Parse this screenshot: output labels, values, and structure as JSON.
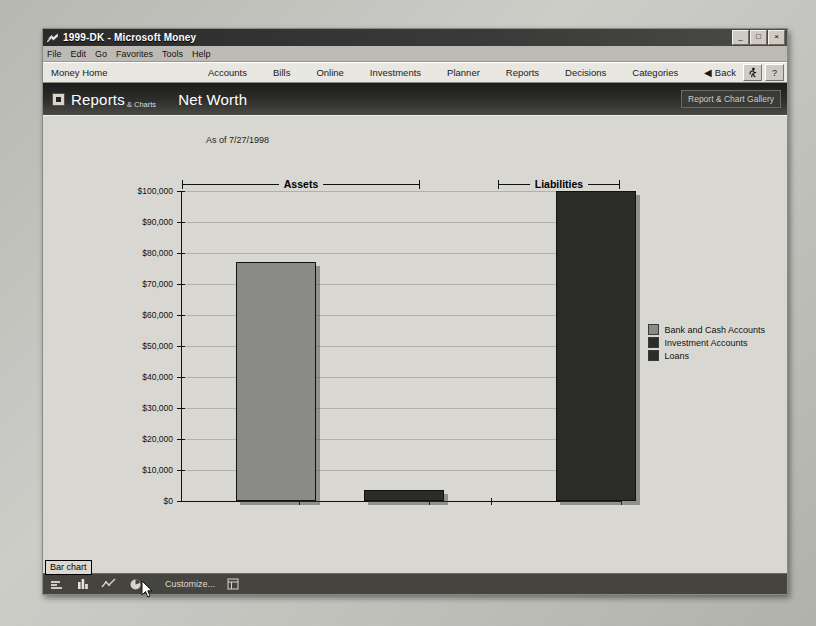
{
  "window": {
    "title": "1999-DK - Microsoft Money",
    "app_icon": "money-logo-icon",
    "controls": {
      "minimize": "_",
      "maximize": "□",
      "close": "×"
    }
  },
  "menubar": {
    "items": [
      {
        "label": "File",
        "accel": "F"
      },
      {
        "label": "Edit",
        "accel": "E"
      },
      {
        "label": "Go",
        "accel": "G"
      },
      {
        "label": "Favorites",
        "accel": "a"
      },
      {
        "label": "Tools",
        "accel": "T"
      },
      {
        "label": "Help",
        "accel": "H"
      }
    ]
  },
  "navbar": {
    "home": "Money Home",
    "items": [
      "Accounts",
      "Bills",
      "Online",
      "Investments",
      "Planner",
      "Reports",
      "Decisions",
      "Categories"
    ],
    "back": "◀ Back",
    "icons": [
      "running-man-icon",
      "help-question-icon"
    ],
    "help_label": "?"
  },
  "banner": {
    "section": "Reports",
    "section_sub": "& Charts",
    "title": "Net Worth",
    "gallery_button": "Report & Chart Gallery",
    "expand_icon": "expand-box-icon"
  },
  "statusbar": {
    "tooltip": "Bar chart",
    "customize": "Customize...",
    "icons": [
      "bar-chart-icon",
      "column-chart-icon",
      "line-chart-icon",
      "pie-chart-icon",
      "report-table-icon"
    ]
  },
  "colors": {
    "bank_and_cash": "#8a8a86",
    "investment": "#2b2b28",
    "loans": "#2b2b28",
    "canvas": "#d9d7d1",
    "banner": "#2e2e2c",
    "gridline": "#b3b0aa"
  },
  "chart_data": {
    "type": "bar",
    "title": "Net Worth",
    "subtitle": "As of 7/27/1998",
    "xlabel": "",
    "ylabel": "",
    "ylim": [
      0,
      100000
    ],
    "ytick_labels": [
      "$0",
      "$10,000",
      "$20,000",
      "$30,000",
      "$40,000",
      "$50,000",
      "$60,000",
      "$70,000",
      "$80,000",
      "$90,000",
      "$100,000"
    ],
    "ytick_values": [
      0,
      10000,
      20000,
      30000,
      40000,
      50000,
      60000,
      70000,
      80000,
      90000,
      100000
    ],
    "grid": true,
    "legend_position": "right",
    "groups": [
      "Assets",
      "Liabilities"
    ],
    "categories": [
      "Bank and Cash Accounts",
      "Investment Accounts",
      "Loans"
    ],
    "values": [
      77000,
      3500,
      100000
    ],
    "series": [
      {
        "name": "Bank and Cash Accounts",
        "group": "Assets",
        "value": 77000,
        "color": "#8a8a86"
      },
      {
        "name": "Investment Accounts",
        "group": "Assets",
        "value": 3500,
        "color": "#2b2b28"
      },
      {
        "name": "Loans",
        "group": "Liabilities",
        "value": 100000,
        "color": "#2b2b28"
      }
    ],
    "legend": [
      {
        "label": "Bank and Cash Accounts",
        "color": "#8a8a86"
      },
      {
        "label": "Investment Accounts",
        "color": "#2b2b28"
      },
      {
        "label": "Loans",
        "color": "#2b2b28"
      }
    ]
  }
}
